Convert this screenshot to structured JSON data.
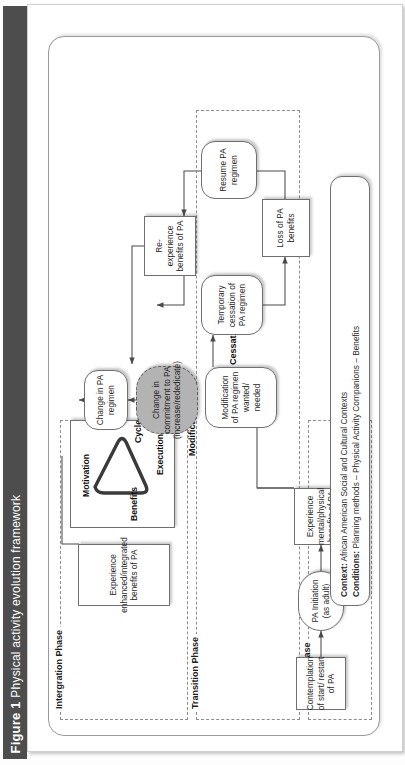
{
  "caption": {
    "number": "Figure 1",
    "text": "Physical activity evolution framework"
  },
  "phases": {
    "initiation": {
      "label": "Initiation Phase"
    },
    "transition": {
      "label": "Transition Phase"
    },
    "integration": {
      "label": "Intergration Phase"
    }
  },
  "loops": {
    "modification": "Modification Loop",
    "cessation": "Cessation Loop"
  },
  "nodes": {
    "contemplation": "Contemplation of start/ restart of PA",
    "pa_initiation": "PA Initiation (as adult)",
    "experience_benefits": "Experience mental/physical benefits of PA",
    "modification_wanted": "Modification of PA regimen wanted/ needed",
    "change_commitment": "Change in commitment to PA (increase/rededicate)",
    "change_regimen": "Change in PA regimen",
    "temporary_cessation": "Temporary cessation of PA regimen",
    "loss_benefits": "Loss of PA benefits",
    "resume_regimen": "Resume PA regimen",
    "reexperience_benefits": "Re-experience benefits of PA",
    "experience_enhanced": "Experience enhanced/integrated benefits of PA"
  },
  "cycle": {
    "motivation": "Motivation",
    "execution": "Execution",
    "benefits": "Benefits",
    "cycle": "Cycle"
  },
  "context_box": {
    "context_label": "Context:",
    "context_value": " African American Social and Cultural Contexts",
    "conditions_label": "Conditions:",
    "conditions_value": " Planning methods – Physical Activity Companions – Benefits"
  },
  "colors": {
    "caption_bar": "#4d4d4d",
    "gray_node": "#b3b3b3",
    "border": "#6f6f6f",
    "dashed": "#8d8d8d"
  }
}
